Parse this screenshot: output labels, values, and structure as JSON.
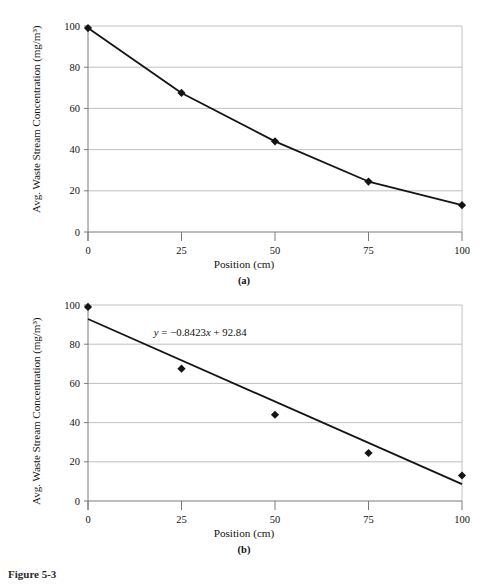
{
  "figure": {
    "caption_label": "Figure 5-3",
    "caption_rest": "",
    "background": "#ffffff",
    "ink": "#111111",
    "grid_color": "#b9b9b9",
    "axis_color": "#7a7a7a",
    "series_color": "#141414"
  },
  "panels": [
    {
      "id": "a",
      "panel_label": "(a)",
      "ylabel": "Avg. Waste Stream Concentration (mg/m³)",
      "xlabel": "Position (cm)"
    },
    {
      "id": "b",
      "panel_label": "(b)",
      "ylabel": "Avg. Waste Stream Concentration (mg/m³)",
      "xlabel": "Position (cm)"
    }
  ],
  "chart_data": [
    {
      "type": "line",
      "panel": "(a)",
      "title": "",
      "xlabel": "Position (cm)",
      "ylabel": "Avg. Waste Stream Concentration (mg/m³)",
      "x": [
        0,
        25,
        50,
        75,
        100
      ],
      "values": [
        99,
        67.5,
        44,
        24.5,
        13
      ],
      "series": [
        {
          "name": "Avg. Waste Stream Concentration",
          "x": [
            0,
            25,
            50,
            75,
            100
          ],
          "values": [
            99,
            67.5,
            44,
            24.5,
            13
          ],
          "marker": "diamond",
          "line": "solid",
          "color": "#141414"
        }
      ],
      "xlim": [
        0,
        100
      ],
      "ylim": [
        0,
        100
      ],
      "xticks": [
        0,
        25,
        50,
        75,
        100
      ],
      "yticks": [
        0,
        20,
        40,
        60,
        80,
        100
      ],
      "xticklabels": [
        "0",
        "25",
        "50",
        "75",
        "100"
      ],
      "yticklabels": [
        "0",
        "20",
        "40",
        "60",
        "80",
        "100"
      ],
      "grid": "horizontal",
      "legend": "none",
      "annotations": []
    },
    {
      "type": "scatter",
      "panel": "(b)",
      "title": "",
      "xlabel": "Position (cm)",
      "ylabel": "Avg. Waste Stream Concentration (mg/m³)",
      "x": [
        0,
        25,
        50,
        75,
        100
      ],
      "values": [
        99,
        67.5,
        44,
        24.5,
        13
      ],
      "series": [
        {
          "name": "Avg. Waste Stream Concentration",
          "x": [
            0,
            25,
            50,
            75,
            100
          ],
          "values": [
            99,
            67.5,
            44,
            24.5,
            13
          ],
          "marker": "diamond",
          "line": "none",
          "color": "#141414"
        },
        {
          "name": "Linear trendline",
          "type": "trendline",
          "equation": "y = −0.8423x + 92.84",
          "slope": -0.8423,
          "intercept": 92.84,
          "x": [
            0,
            100
          ],
          "values": [
            92.84,
            8.61
          ],
          "marker": "none",
          "line": "solid",
          "color": "#141414"
        }
      ],
      "xlim": [
        0,
        100
      ],
      "ylim": [
        0,
        100
      ],
      "xticks": [
        0,
        25,
        50,
        75,
        100
      ],
      "yticks": [
        0,
        20,
        40,
        60,
        80,
        100
      ],
      "xticklabels": [
        "0",
        "25",
        "50",
        "75",
        "100"
      ],
      "yticklabels": [
        "0",
        "20",
        "40",
        "60",
        "80",
        "100"
      ],
      "grid": "horizontal",
      "legend": "none",
      "annotations": [
        {
          "name": "trendline-equation",
          "text": "y = −0.8423x + 92.84",
          "x": 30,
          "y": 84
        }
      ]
    }
  ]
}
